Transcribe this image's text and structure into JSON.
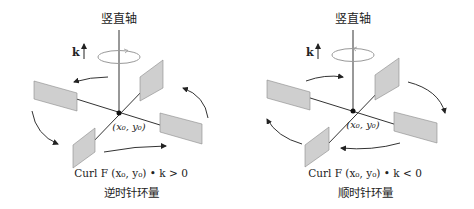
{
  "panels": [
    {
      "id": "counterclockwise",
      "axis_title": "竖直轴",
      "unit_vector": "k",
      "point_label": "(x₀, y₀)",
      "formula": "Curl F (x₀, y₀) • k  > 0",
      "caption": "逆时针环量",
      "rotation": "counterclockwise"
    },
    {
      "id": "clockwise",
      "axis_title": "竖直轴",
      "unit_vector": "k",
      "point_label": "(x₀, y₀)",
      "formula": "Curl F (x₀, y₀) • k < 0",
      "caption": "顺时针环量",
      "rotation": "clockwise"
    }
  ],
  "colors": {
    "paddle_fill": "#cfcfcf",
    "paddle_edge": "#8a8a8a",
    "line": "#333333",
    "ellipse": "#888888"
  }
}
